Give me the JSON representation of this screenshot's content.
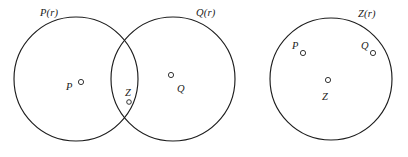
{
  "figure": {
    "kind": "venn-diagram",
    "background_color": "#ffffff",
    "stroke_color": "#1d1d1d",
    "text_color": "#202020",
    "diagrams": [
      {
        "name": "left-diagram",
        "description": "Two overlapping circles P(r) and Q(r) with points P, Z, Q",
        "set_labels": [
          {
            "id": "p-of-r",
            "text": "P(r)",
            "x": 40,
            "y": 8
          },
          {
            "id": "q-of-r",
            "text": "Q(r)",
            "x": 196,
            "y": 8
          }
        ],
        "circles": [
          {
            "id": "circle-p",
            "cx": 76,
            "cy": 79,
            "r": 62
          },
          {
            "id": "circle-q",
            "cx": 173,
            "cy": 79,
            "r": 62
          }
        ],
        "points": [
          {
            "id": "point-p",
            "label": "P",
            "label_x": 66,
            "label_y": 82,
            "dot_x": 81,
            "dot_y": 82,
            "dot_r": 2.6
          },
          {
            "id": "point-z",
            "label": "Z",
            "label_x": 125,
            "label_y": 88,
            "dot_x": 129,
            "dot_y": 102,
            "dot_r": 2.3
          },
          {
            "id": "point-q",
            "label": "Q",
            "label_x": 177,
            "label_y": 84,
            "dot_x": 171,
            "dot_y": 75,
            "dot_r": 2.6
          }
        ]
      },
      {
        "name": "right-diagram",
        "description": "Single circle Z(r) containing points P, Q and center point Z",
        "set_labels": [
          {
            "id": "z-of-r",
            "text": "Z(r)",
            "x": 358,
            "y": 9
          }
        ],
        "circles": [
          {
            "id": "circle-z",
            "cx": 331,
            "cy": 79,
            "r": 61
          }
        ],
        "points": [
          {
            "id": "point-p-right",
            "label": "P",
            "label_x": 292,
            "label_y": 41,
            "dot_x": 303,
            "dot_y": 53,
            "dot_r": 2.6
          },
          {
            "id": "point-q-right",
            "label": "Q",
            "label_x": 361,
            "label_y": 41,
            "dot_x": 373,
            "dot_y": 53,
            "dot_r": 2.6
          },
          {
            "id": "point-z-right",
            "label": "Z",
            "label_x": 322,
            "label_y": 92,
            "dot_x": 328,
            "dot_y": 80,
            "dot_r": 2.6
          }
        ]
      }
    ]
  },
  "labels": {
    "left": {
      "set_p": "P(r)",
      "set_q": "Q(r)",
      "point_p": "P",
      "point_z": "Z",
      "point_q": "Q"
    },
    "right": {
      "set_z": "Z(r)",
      "point_p": "P",
      "point_q": "Q",
      "point_z": "Z"
    }
  }
}
